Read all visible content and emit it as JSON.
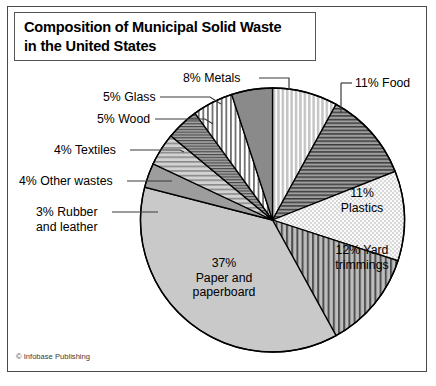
{
  "title": {
    "line1": "Composition of Municipal Solid Waste",
    "line2": "in the United States"
  },
  "credit": "© Infobase Publishing",
  "labels": {
    "metals": "8% Metals",
    "glass": "5% Glass",
    "wood": "5% Wood",
    "textiles": "4% Textiles",
    "other_wastes": "4% Other wastes",
    "rubber_line1": "3% Rubber",
    "rubber_line2": "and leather",
    "food": "11% Food",
    "plastics_line1": "11%",
    "plastics_line2": "Plastics",
    "yard_line1": "12% Yard",
    "yard_line2": "trimmings",
    "paper_line1": "37%",
    "paper_line2": "Paper and",
    "paper_line3": "paperboard"
  },
  "colors": {
    "frame": "#4a4a4a",
    "slice_outline": "#000000",
    "paper_fill": "#c9c9c9",
    "glass_fill": "#8c8c8c",
    "rubber_fill": "#9a9a9a",
    "food_fill": "#9e9e9e",
    "metals_fill": "#d9d9d9",
    "plastics_fill": "#f2f2f2",
    "yard_fill": "#b5b5b5",
    "textiles_fill": "#a2a2a2",
    "other_fill": "#c0c0c0",
    "wood_fill": "#ffffff",
    "text": "#000000"
  },
  "chart_data": {
    "type": "pie",
    "title": "Composition of Municipal Solid Waste in the United States",
    "units": "percent",
    "total": 100,
    "start_angle_deg": 0,
    "direction": "clockwise",
    "legend": "none (direct labels)",
    "categories": [
      "Paper and paperboard",
      "Yard trimmings",
      "Food",
      "Plastics",
      "Metals",
      "Glass",
      "Wood",
      "Textiles",
      "Other wastes",
      "Rubber and leather"
    ],
    "values": [
      37,
      12,
      11,
      11,
      8,
      5,
      5,
      4,
      4,
      3
    ],
    "slices": [
      {
        "label": "Metals",
        "value": 8,
        "display": "8% Metals",
        "pattern": "vertical-stripes",
        "fill": "#d9d9d9",
        "label_placement": "outside-leader"
      },
      {
        "label": "Food",
        "value": 11,
        "display": "11% Food",
        "pattern": "horizontal-lines",
        "fill": "#9e9e9e",
        "label_placement": "outside-leader"
      },
      {
        "label": "Plastics",
        "value": 11,
        "display": "11% Plastics",
        "pattern": "dots",
        "fill": "#f2f2f2",
        "label_placement": "inside"
      },
      {
        "label": "Yard trimmings",
        "value": 12,
        "display": "12% Yard trimmings",
        "pattern": "vertical-stripes-bold",
        "fill": "#b5b5b5",
        "label_placement": "inside"
      },
      {
        "label": "Paper and paperboard",
        "value": 37,
        "display": "37% Paper and paperboard",
        "pattern": "solid",
        "fill": "#c9c9c9",
        "label_placement": "inside"
      },
      {
        "label": "Rubber and leather",
        "value": 3,
        "display": "3% Rubber and leather",
        "pattern": "solid",
        "fill": "#9a9a9a",
        "label_placement": "outside-leader"
      },
      {
        "label": "Other wastes",
        "value": 4,
        "display": "4% Other wastes",
        "pattern": "horizontal-lines-wide",
        "fill": "#c0c0c0",
        "label_placement": "outside-leader"
      },
      {
        "label": "Textiles",
        "value": 4,
        "display": "4% Textiles",
        "pattern": "horizontal-lines-fine",
        "fill": "#a2a2a2",
        "label_placement": "outside-leader"
      },
      {
        "label": "Wood",
        "value": 5,
        "display": "5% Wood",
        "pattern": "vertical-stripes-fine",
        "fill": "#ffffff",
        "label_placement": "outside-leader"
      },
      {
        "label": "Glass",
        "value": 5,
        "display": "5% Glass",
        "pattern": "solid",
        "fill": "#8c8c8c",
        "label_placement": "outside-leader"
      }
    ]
  }
}
